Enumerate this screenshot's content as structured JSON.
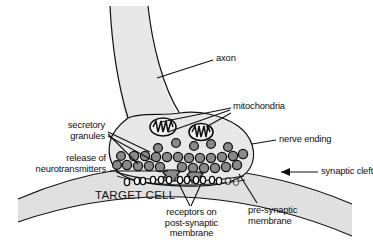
{
  "figure": {
    "background_color": "#ffffff",
    "ink_color": "#101010"
  },
  "labels": {
    "axon": "axon",
    "mitochondria": "mitochondria",
    "nerve_ending": "nerve ending",
    "secretory_granules_line1": "secretory",
    "secretory_granules_line2": "granules",
    "release_line1": "release of",
    "release_line2": "neurotransmitters",
    "synaptic_cleft": "synaptic cleft",
    "target_cell": "TARGET CELL",
    "receptors_line1": "receptors on",
    "receptors_line2": "post-synaptic",
    "receptors_line3": "membrane",
    "presynaptic_line1": "pre-synaptic",
    "presynaptic_line2": "membrane"
  },
  "structures": {
    "axon_fill": "#e8e8e8",
    "terminal_fill": "#e8e8e8",
    "target_cell_fill": "#e0e0e0",
    "vesicle_fill": "#8a8a8a",
    "vesicle_stroke": "#111111",
    "mitochondria_fill": "#f2f2f2",
    "mitochondria_stroke": "#111111",
    "receptor_fill": "#ffffff",
    "receptor_stroke": "#111111",
    "leader_stroke": "#101010",
    "vesicle_count": 34,
    "mitochondria_count": 2,
    "receptor_count": 14,
    "fusing_vesicle_count": 2
  }
}
